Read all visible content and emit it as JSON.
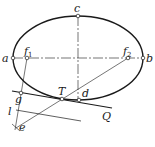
{
  "diagram": {
    "labels": {
      "a": "a",
      "b": "b",
      "c": "c",
      "d": "d",
      "f1": "f",
      "f1_sub": "1",
      "f2": "f",
      "f2_sub": "2",
      "T": "T",
      "Q": "Q",
      "g": "g",
      "l": "l",
      "e": "e"
    },
    "caption": "",
    "colors": {
      "stroke": "#1a1a1a",
      "background": "#ffffff"
    }
  }
}
